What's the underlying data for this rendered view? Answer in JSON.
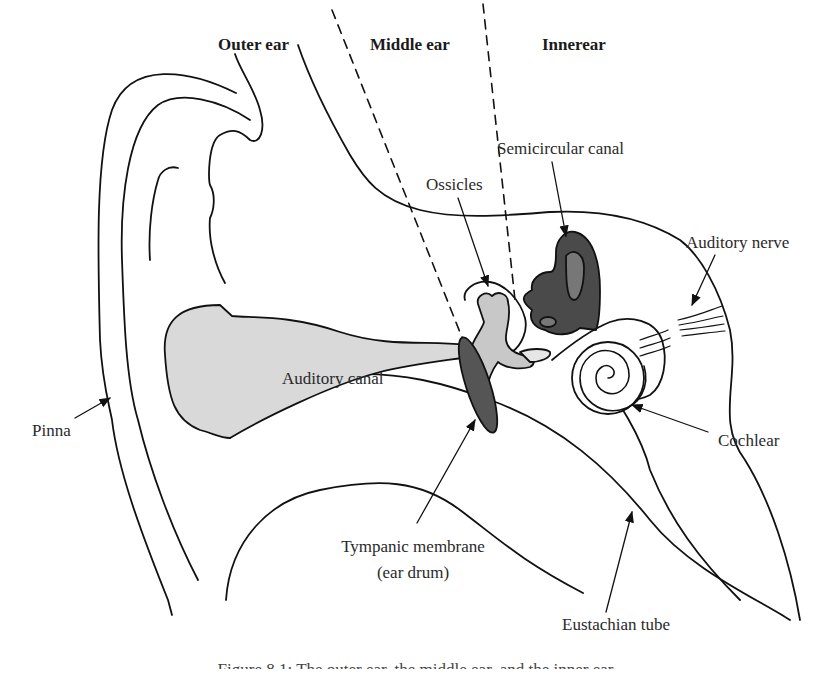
{
  "figure": {
    "regions": {
      "outer": "Outer ear",
      "middle": "Middle ear",
      "inner": "Innerear"
    },
    "labels": {
      "semicircular_canal": "Semicircular canal",
      "ossicles": "Ossicles",
      "auditory_nerve": "Auditory nerve",
      "auditory_canal": "Auditory canal",
      "pinna": "Pinna",
      "cochlear": "Cochlear",
      "tympanic_membrane": "Tympanic membrane",
      "ear_drum": "(ear drum)",
      "eustachian_tube": "Eustachian tube"
    },
    "caption": "Figure 8.1: The outer ear, the middle ear, and the inner ear",
    "colors": {
      "canal_fill": "#d9d9d9",
      "ossicle_fill": "#c8c8c8",
      "membrane_fill": "#555555",
      "semicircular_fill": "#4a4a4a",
      "line": "#111111"
    }
  }
}
